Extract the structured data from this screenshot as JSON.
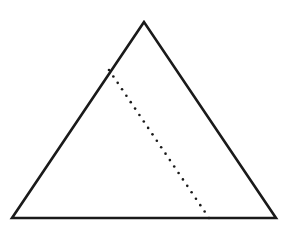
{
  "diagram": {
    "type": "geometry",
    "width": 281,
    "height": 233,
    "background": "#ffffff",
    "stroke_color": "#1a1a1a",
    "triangle": {
      "points": [
        [
          144,
          22
        ],
        [
          12,
          218
        ],
        [
          276,
          218
        ]
      ],
      "stroke_width": 2.6
    },
    "dotted_segment": {
      "from": [
        109,
        70
      ],
      "to": [
        209,
        218
      ],
      "dot_radius": 1.3,
      "dot_spacing": 7.8
    },
    "labels": []
  }
}
